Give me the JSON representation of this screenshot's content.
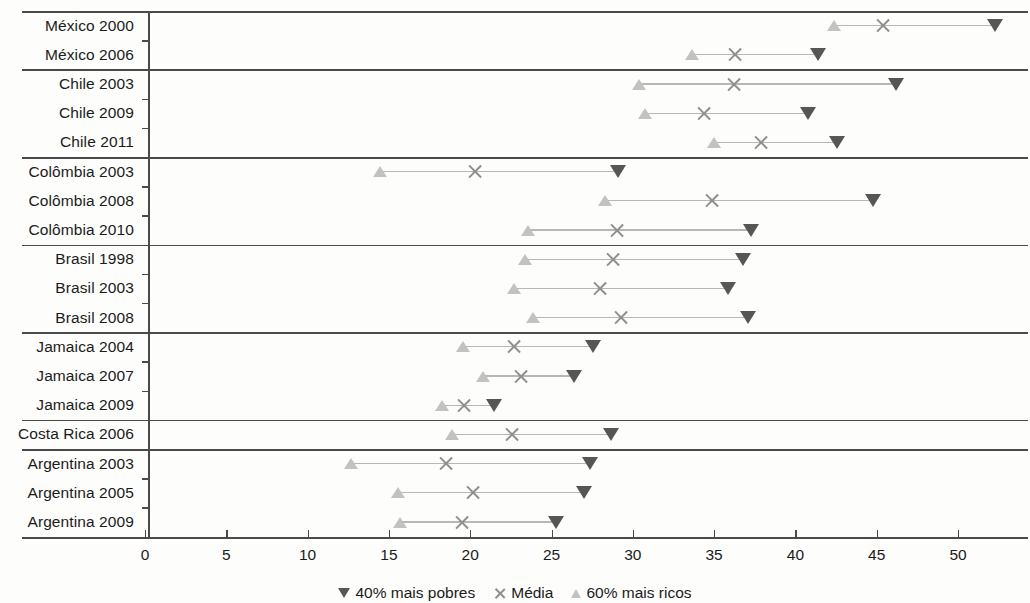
{
  "chart_data": {
    "type": "scatter",
    "title": "",
    "subtitle": "",
    "xlabel": "",
    "ylabel": "",
    "xlim": [
      0,
      53.5
    ],
    "xticks": [
      0,
      5,
      10,
      15,
      20,
      25,
      30,
      35,
      40,
      45,
      50
    ],
    "xticklabels": [
      "0",
      "5",
      "10",
      "15",
      "20",
      "25",
      "30",
      "35",
      "40",
      "45",
      "50"
    ],
    "grid": false,
    "legend_position": "bottom",
    "series": [
      {
        "name": "40% mais pobres",
        "marker": "triangle-down",
        "color": "#565656"
      },
      {
        "name": "Média",
        "marker": "x",
        "color": "#8f8f8f"
      },
      {
        "name": "60% mais ricos",
        "marker": "triangle-up",
        "color": "#c2c2c2"
      }
    ],
    "categories": [
      "México 2000",
      "México 2006",
      "Chile 2003",
      "Chile 2009",
      "Chile 2011",
      "Colômbia 2003",
      "Colômbia 2008",
      "Colômbia 2010",
      "Brasil 1998",
      "Brasil 2003",
      "Brasil 2008",
      "Jamaica 2004",
      "Jamaica 2007",
      "Jamaica 2009",
      "Costa Rica 2006",
      "Argentina 2003",
      "Argentina 2005",
      "Argentina 2009"
    ],
    "rows": [
      {
        "label": "México 2000",
        "group": "México",
        "poorest40": 52.3,
        "media": 45.4,
        "richest60": 42.4
      },
      {
        "label": "México 2006",
        "group": "México",
        "poorest40": 41.4,
        "media": 36.3,
        "richest60": 33.7
      },
      {
        "label": "Chile 2003",
        "group": "Chile",
        "poorest40": 46.2,
        "media": 36.2,
        "richest60": 30.4
      },
      {
        "label": "Chile 2009",
        "group": "Chile",
        "poorest40": 40.8,
        "media": 34.4,
        "richest60": 30.8
      },
      {
        "label": "Chile 2011",
        "group": "Chile",
        "poorest40": 42.6,
        "media": 37.9,
        "richest60": 35.0
      },
      {
        "label": "Colômbia 2003",
        "group": "Colômbia",
        "poorest40": 29.1,
        "media": 20.3,
        "richest60": 14.5
      },
      {
        "label": "Colômbia 2008",
        "group": "Colômbia",
        "poorest40": 44.8,
        "media": 34.9,
        "richest60": 28.3
      },
      {
        "label": "Colômbia 2010",
        "group": "Colômbia",
        "poorest40": 37.3,
        "media": 29.0,
        "richest60": 23.6
      },
      {
        "label": "Brasil 1998",
        "group": "Brasil",
        "poorest40": 36.8,
        "media": 28.8,
        "richest60": 23.4
      },
      {
        "label": "Brasil 2003",
        "group": "Brasil",
        "poorest40": 35.9,
        "media": 28.0,
        "richest60": 22.7
      },
      {
        "label": "Brasil 2008",
        "group": "Brasil",
        "poorest40": 37.1,
        "media": 29.3,
        "richest60": 23.9
      },
      {
        "label": "Jamaica 2004",
        "group": "Jamaica",
        "poorest40": 27.6,
        "media": 22.7,
        "richest60": 19.6
      },
      {
        "label": "Jamaica 2007",
        "group": "Jamaica",
        "poorest40": 26.4,
        "media": 23.1,
        "richest60": 20.8
      },
      {
        "label": "Jamaica 2009",
        "group": "Jamaica",
        "poorest40": 21.5,
        "media": 19.6,
        "richest60": 18.3
      },
      {
        "label": "Costa Rica 2006",
        "group": "Costa Rica",
        "poorest40": 28.7,
        "media": 22.6,
        "richest60": 18.9
      },
      {
        "label": "Argentina 2003",
        "group": "Argentina",
        "poorest40": 27.4,
        "media": 18.5,
        "richest60": 12.7
      },
      {
        "label": "Argentina 2005",
        "group": "Argentina",
        "poorest40": 27.0,
        "media": 20.2,
        "richest60": 15.6
      },
      {
        "label": "Argentina 2009",
        "group": "Argentina",
        "poorest40": 25.3,
        "media": 19.5,
        "richest60": 15.7
      }
    ]
  },
  "legend": {
    "items": [
      {
        "label": "40% mais pobres",
        "marker": "triangle-down-icon"
      },
      {
        "label": "Média",
        "marker": "x-cross-icon"
      },
      {
        "label": "60% mais ricos",
        "marker": "triangle-up-icon"
      }
    ]
  }
}
